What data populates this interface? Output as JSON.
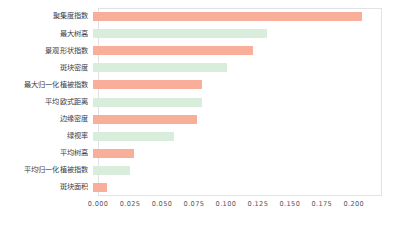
{
  "chart_data": {
    "type": "bar",
    "orientation": "horizontal",
    "title": "",
    "xlabel": "",
    "ylabel": "",
    "xlim": [
      0.0,
      0.222
    ],
    "grid": false,
    "legend": null,
    "categories": [
      "聚集度指数",
      "最大树高",
      "景观形状指数",
      "斑块密度",
      "最大归一化植被指数",
      "平均欧式距离",
      "边缘密度",
      "绿视率",
      "平均树高",
      "平均归一化植被指数",
      "斑块面积"
    ],
    "values": [
      0.21,
      0.136,
      0.125,
      0.105,
      0.085,
      0.085,
      0.081,
      0.063,
      0.032,
      0.029,
      0.011
    ],
    "colors": [
      "#f8ae98",
      "#d9eddd",
      "#f8ae98",
      "#d9eddd",
      "#f8ae98",
      "#d9eddd",
      "#f8ae98",
      "#d9eddd",
      "#f8ae98",
      "#d9eddd",
      "#f8ae98"
    ],
    "bars": [
      {
        "label": "聚集度指数",
        "value": 0.21,
        "color": "#f8ae98"
      },
      {
        "label": "最大树高",
        "value": 0.136,
        "color": "#d9eddd"
      },
      {
        "label": "景观形状指数",
        "value": 0.125,
        "color": "#f8ae98"
      },
      {
        "label": "斑块密度",
        "value": 0.105,
        "color": "#d9eddd"
      },
      {
        "label": "最大归一化植被指数",
        "value": 0.085,
        "color": "#f8ae98"
      },
      {
        "label": "平均欧式距离",
        "value": 0.085,
        "color": "#d9eddd"
      },
      {
        "label": "边缘密度",
        "value": 0.081,
        "color": "#f8ae98"
      },
      {
        "label": "绿视率",
        "value": 0.063,
        "color": "#d9eddd"
      },
      {
        "label": "平均树高",
        "value": 0.032,
        "color": "#f8ae98"
      },
      {
        "label": "平均归一化植被指数",
        "value": 0.029,
        "color": "#d9eddd"
      },
      {
        "label": "斑块面积",
        "value": 0.011,
        "color": "#f8ae98"
      }
    ],
    "xticks": [
      0.0,
      0.025,
      0.05,
      0.075,
      0.1,
      0.125,
      0.15,
      0.175,
      0.2
    ],
    "xticklabels": [
      "0.000",
      "0.025",
      "0.050",
      "0.075",
      "0.100",
      "0.125",
      "0.150",
      "0.175",
      "0.200"
    ]
  },
  "style": {
    "accent_salmon": "#f8ae98",
    "accent_mint": "#d9eddd",
    "frame_color": "#e2e2e6",
    "text_color": "#3c3c44",
    "background": "#ffffff"
  }
}
